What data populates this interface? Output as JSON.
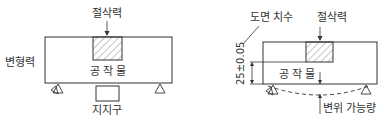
{
  "left_diagram": {
    "cutting_force_label": "절삭력",
    "deformation_force_label": "변형력",
    "workpiece_label": "공 작 물",
    "fixture_label": "지지구"
  },
  "right_diagram": {
    "drawing_dimension_label": "도면 치수",
    "cutting_force_label": "절삭력",
    "workpiece_label": "공 작 물",
    "dimension_value": "25±0.05",
    "displacement_label": "변위 가능량"
  },
  "colors": {
    "line": "#333333",
    "background": "#ffffff"
  }
}
